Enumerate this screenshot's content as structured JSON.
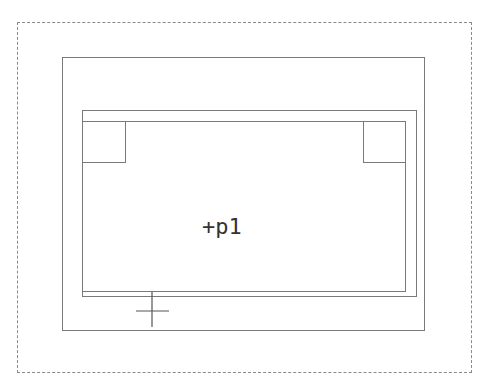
{
  "diagram": {
    "label": "+p1",
    "colors": {
      "line": "#7a7a7a",
      "dashed": "#8a8a8a",
      "text": "#333333",
      "background": "#ffffff"
    },
    "shapes": {
      "outer_dashed_boundary": {
        "x": 17,
        "y": 22,
        "w": 455,
        "h": 351
      },
      "frame": {
        "x": 62,
        "y": 57,
        "w": 363,
        "h": 274
      },
      "back_rect": {
        "x": 82,
        "y": 110,
        "w": 335,
        "h": 187
      },
      "main_rect": {
        "x": 82,
        "y": 121,
        "w": 324,
        "h": 171
      },
      "corner_box_left": {
        "x": 82,
        "y": 121,
        "w": 44,
        "h": 42
      },
      "corner_box_right": {
        "x": 363,
        "y": 121,
        "w": 43,
        "h": 42
      },
      "crosshair": {
        "x": 152,
        "y": 311
      }
    }
  }
}
